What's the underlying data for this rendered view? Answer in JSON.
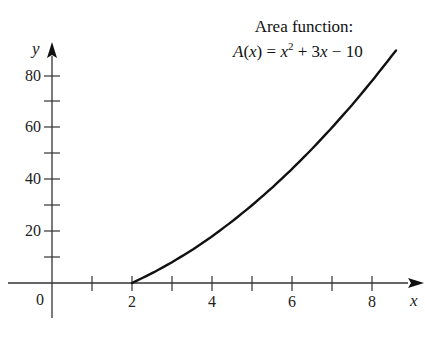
{
  "chart_data": {
    "type": "line",
    "title": "Area function:",
    "subtitle": "A(x) = x^2 + 3x - 10",
    "xlabel": "x",
    "ylabel": "y",
    "xlim": [
      -1,
      9
    ],
    "ylim": [
      -10,
      90
    ],
    "x_ticks": [
      1,
      2,
      3,
      4,
      5,
      6,
      7,
      8
    ],
    "x_tick_labels": [
      "0",
      "2",
      "4",
      "6",
      "8"
    ],
    "y_ticks": [
      10,
      20,
      30,
      40,
      50,
      60,
      70,
      80
    ],
    "y_tick_labels": [
      "20",
      "40",
      "60",
      "80"
    ],
    "grid": false,
    "legend": "none",
    "series": [
      {
        "name": "A(x) = x^2 + 3x - 10",
        "x": [
          2,
          2.5,
          3,
          3.5,
          4,
          4.5,
          5,
          5.5,
          6,
          6.5,
          7,
          7.5,
          8,
          8.6
        ],
        "values": [
          0,
          3.75,
          8,
          12.75,
          18,
          23.75,
          30,
          36.75,
          44,
          51.75,
          60,
          68.75,
          78,
          89.76
        ]
      }
    ]
  },
  "labels": {
    "title_line1": "Area function:",
    "formula_A": "A",
    "formula_x1": "x",
    "formula_eq": "=",
    "formula_x2": "x",
    "formula_exp": "2",
    "formula_plus": "+ 3",
    "formula_x3": "x",
    "formula_minus": "−  10",
    "x_axis": "x",
    "y_axis": "y",
    "origin": "0",
    "x2": "2",
    "x4": "4",
    "x6": "6",
    "x8": "8",
    "y20": "20",
    "y40": "40",
    "y60": "60",
    "y80": "80"
  }
}
